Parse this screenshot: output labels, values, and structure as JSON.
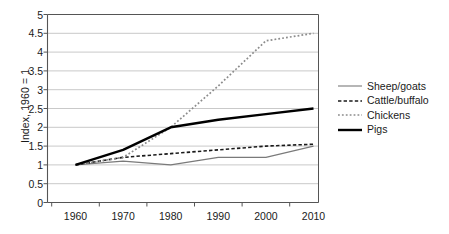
{
  "chart_data": {
    "type": "line",
    "title": "",
    "xlabel": "",
    "ylabel": "Index, 1960 = 1",
    "categories": [
      "1960",
      "1970",
      "1980",
      "1990",
      "2000",
      "2010"
    ],
    "ylim": [
      0,
      5
    ],
    "ytick_step": 0.5,
    "yticks": [
      "0",
      "0.5",
      "1",
      "1.5",
      "2",
      "2.5",
      "3",
      "3.5",
      "4",
      "4.5",
      "5"
    ],
    "grid": "horizontal",
    "legend_position": "right",
    "series": [
      {
        "name": "Sheep/goats",
        "values": [
          1.0,
          1.1,
          1.0,
          1.2,
          1.2,
          1.5
        ],
        "color": "#7a7a7a",
        "style": "solid",
        "width": 1.1
      },
      {
        "name": "Cattle/buffalo",
        "values": [
          1.0,
          1.2,
          1.3,
          1.4,
          1.5,
          1.55
        ],
        "color": "#1a1a1a",
        "style": "dashed",
        "width": 1.6
      },
      {
        "name": "Chickens",
        "values": [
          1.0,
          1.2,
          2.0,
          3.1,
          4.3,
          4.5
        ],
        "color": "#8c8c8c",
        "style": "dotted",
        "width": 1.7
      },
      {
        "name": "Pigs",
        "values": [
          1.0,
          1.4,
          2.0,
          2.2,
          2.35,
          2.5
        ],
        "color": "#000000",
        "style": "solid",
        "width": 2.4
      }
    ]
  },
  "axis": {
    "y_title": "Index, 1960 = 1"
  },
  "legend": {
    "entries": [
      {
        "label": "Sheep/goats"
      },
      {
        "label": "Cattle/buffalo"
      },
      {
        "label": "Chickens"
      },
      {
        "label": "Pigs"
      }
    ]
  },
  "colors": {
    "gridline": "#c9c9c9",
    "axis": "#555555",
    "text": "#1a1a1a",
    "background": "#ffffff"
  }
}
